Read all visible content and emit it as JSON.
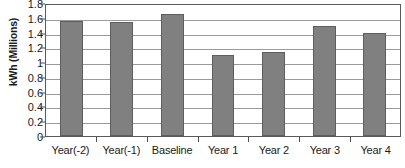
{
  "chart_data": {
    "type": "bar",
    "title": "",
    "xlabel": "",
    "ylabel": "kWh (Millions)",
    "categories": [
      "Year(-2)",
      "Year(-1)",
      "Baseline",
      "Year 1",
      "Year 2",
      "Year 3",
      "Year 4"
    ],
    "values": [
      1.58,
      1.56,
      1.67,
      1.11,
      1.16,
      1.51,
      1.41
    ],
    "ylim": [
      0,
      1.8
    ],
    "ytick_step": 0.2,
    "ytick_labels": [
      "1.8",
      "1.6",
      "1.4",
      "1.2",
      "1",
      "0.8",
      "0.6",
      "0.4",
      "0.2",
      "0"
    ],
    "ytick_values": [
      1.8,
      1.6,
      1.4,
      1.2,
      1.0,
      0.8,
      0.6,
      0.4,
      0.2,
      0
    ],
    "grid": true,
    "grid_orientation": "horizontal",
    "legend": false,
    "legend_position": "none",
    "series": [
      {
        "name": "kWh (Millions)",
        "values": [
          1.58,
          1.56,
          1.67,
          1.11,
          1.16,
          1.51,
          1.41
        ]
      }
    ],
    "colors": {
      "bar_fill": "#808080",
      "bar_border": "#5e5e5e",
      "gridline": "#9a9a9a",
      "axis": "#5a5a5a",
      "text": "#1a1a1a",
      "background": "#ffffff"
    }
  }
}
